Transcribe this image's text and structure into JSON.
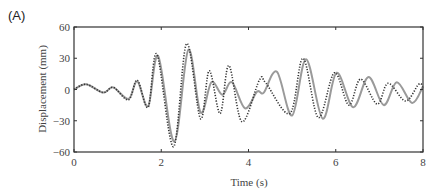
{
  "panel_label": "(A)",
  "chart_data": {
    "type": "line",
    "title": "",
    "xlabel": "Time (s)",
    "ylabel": "Displacement (mm)",
    "xlim": [
      0,
      8
    ],
    "ylim": [
      -60,
      60
    ],
    "xticks": [
      0,
      2,
      4,
      6,
      8
    ],
    "yticks": [
      -60,
      -30,
      0,
      30,
      60
    ],
    "grid": false,
    "legend": null,
    "series": [
      {
        "name": "solid",
        "style": "solid",
        "color": "#9a9a9a",
        "points": [
          [
            0,
            0
          ],
          [
            0.28,
            5
          ],
          [
            0.67,
            -3
          ],
          [
            0.9,
            2
          ],
          [
            1.25,
            -9
          ],
          [
            1.45,
            8
          ],
          [
            1.7,
            -16
          ],
          [
            1.93,
            32
          ],
          [
            2.3,
            -50
          ],
          [
            2.62,
            38
          ],
          [
            2.9,
            -22
          ],
          [
            3.15,
            7
          ],
          [
            3.4,
            -5
          ],
          [
            3.62,
            7
          ],
          [
            3.92,
            -18
          ],
          [
            4.2,
            -2
          ],
          [
            4.35,
            -3
          ],
          [
            4.65,
            17
          ],
          [
            5.0,
            -25
          ],
          [
            5.32,
            29
          ],
          [
            5.7,
            -28
          ],
          [
            6.02,
            16
          ],
          [
            6.4,
            -17
          ],
          [
            6.75,
            12
          ],
          [
            7.1,
            -15
          ],
          [
            7.4,
            7
          ],
          [
            7.75,
            -13
          ],
          [
            8.0,
            3
          ]
        ]
      },
      {
        "name": "dotted",
        "style": "dotted",
        "color": "#333333",
        "points": [
          [
            0,
            0
          ],
          [
            0.28,
            5
          ],
          [
            0.67,
            -3
          ],
          [
            0.9,
            2
          ],
          [
            1.25,
            -10
          ],
          [
            1.45,
            9
          ],
          [
            1.7,
            -17
          ],
          [
            1.9,
            34
          ],
          [
            2.28,
            -55
          ],
          [
            2.58,
            44
          ],
          [
            2.9,
            -28
          ],
          [
            3.1,
            18
          ],
          [
            3.35,
            -23
          ],
          [
            3.55,
            23
          ],
          [
            3.85,
            -31
          ],
          [
            4.25,
            9
          ],
          [
            4.4,
            6
          ],
          [
            4.95,
            -23
          ],
          [
            5.25,
            30
          ],
          [
            5.6,
            -27
          ],
          [
            5.97,
            16
          ],
          [
            6.3,
            -15
          ],
          [
            6.57,
            10
          ],
          [
            6.95,
            -14
          ],
          [
            7.2,
            6
          ],
          [
            7.6,
            -11
          ],
          [
            7.9,
            5
          ],
          [
            8.0,
            3
          ]
        ]
      }
    ]
  }
}
